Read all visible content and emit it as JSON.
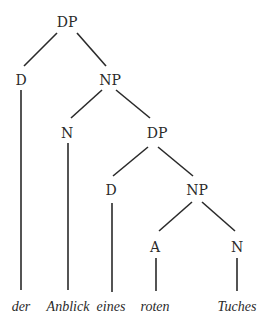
{
  "diagram": {
    "type": "syntax-tree",
    "colors": {
      "ink": "#2a2a2a",
      "background": "#ffffff"
    },
    "nodes": [
      {
        "id": "dp1",
        "label": "DP",
        "x": 67,
        "y": 27
      },
      {
        "id": "d1",
        "label": "D",
        "x": 21,
        "y": 85
      },
      {
        "id": "np1",
        "label": "NP",
        "x": 110,
        "y": 85
      },
      {
        "id": "n1",
        "label": "N",
        "x": 67,
        "y": 138
      },
      {
        "id": "dp2",
        "label": "DP",
        "x": 157,
        "y": 138
      },
      {
        "id": "d2",
        "label": "D",
        "x": 111,
        "y": 195
      },
      {
        "id": "np2",
        "label": "NP",
        "x": 197,
        "y": 195
      },
      {
        "id": "a1",
        "label": "A",
        "x": 155,
        "y": 252
      },
      {
        "id": "n2",
        "label": "N",
        "x": 237,
        "y": 252
      }
    ],
    "leaves": [
      {
        "id": "w1",
        "label": "der",
        "x": 21,
        "y": 311
      },
      {
        "id": "w2",
        "label": "Anblick",
        "x": 68,
        "y": 311
      },
      {
        "id": "w3",
        "label": "eines",
        "x": 111,
        "y": 311
      },
      {
        "id": "w4",
        "label": "roten",
        "x": 155,
        "y": 311
      },
      {
        "id": "w5",
        "label": "Tuches",
        "x": 237,
        "y": 311
      }
    ],
    "edges": [
      {
        "from": "dp1",
        "to": "d1",
        "x1": 57,
        "y1": 33,
        "x2": 24,
        "y2": 66
      },
      {
        "from": "dp1",
        "to": "np1",
        "x1": 77,
        "y1": 33,
        "x2": 106,
        "y2": 66
      },
      {
        "from": "d1",
        "to": "w1",
        "x1": 21,
        "y1": 90,
        "x2": 21,
        "y2": 290
      },
      {
        "from": "np1",
        "to": "n1",
        "x1": 102,
        "y1": 90,
        "x2": 71,
        "y2": 118
      },
      {
        "from": "np1",
        "to": "dp2",
        "x1": 116,
        "y1": 90,
        "x2": 150,
        "y2": 118
      },
      {
        "from": "n1",
        "to": "w2",
        "x1": 68,
        "y1": 143,
        "x2": 68,
        "y2": 290
      },
      {
        "from": "dp2",
        "to": "d2",
        "x1": 148,
        "y1": 147,
        "x2": 113,
        "y2": 176
      },
      {
        "from": "dp2",
        "to": "np2",
        "x1": 158,
        "y1": 147,
        "x2": 193,
        "y2": 176
      },
      {
        "from": "d2",
        "to": "w3",
        "x1": 112,
        "y1": 203,
        "x2": 112,
        "y2": 292
      },
      {
        "from": "np2",
        "to": "a1",
        "x1": 192,
        "y1": 202,
        "x2": 159,
        "y2": 231
      },
      {
        "from": "np2",
        "to": "n2",
        "x1": 202,
        "y1": 202,
        "x2": 235,
        "y2": 231
      },
      {
        "from": "a1",
        "to": "w4",
        "x1": 156,
        "y1": 258,
        "x2": 156,
        "y2": 291
      },
      {
        "from": "n2",
        "to": "w5",
        "x1": 237,
        "y1": 258,
        "x2": 237,
        "y2": 291
      }
    ]
  }
}
